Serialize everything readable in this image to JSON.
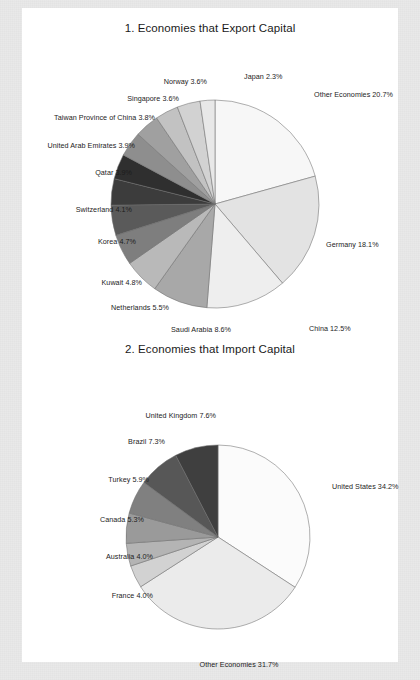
{
  "page": {
    "background_color": "#e9e9e9",
    "sheet_color": "#ffffff"
  },
  "chart_data": [
    {
      "type": "pie",
      "id": "export-capital",
      "title": "1. Economies that Export Capital",
      "xlabel": "",
      "ylabel": "",
      "units": "percent",
      "legend": "none (direct labels with leader placement)",
      "grid": false,
      "start_angle_deg": -90,
      "direction": "clockwise",
      "categories": [
        "Other Economies",
        "Germany",
        "China",
        "Saudi Arabia",
        "Netherlands",
        "Kuwait",
        "Korea",
        "Switzerland",
        "Qatar",
        "United Arab Emirates",
        "Taiwan Province of China",
        "Singapore",
        "Norway",
        "Japan"
      ],
      "values": [
        20.7,
        18.1,
        12.5,
        8.6,
        5.5,
        4.8,
        4.7,
        4.1,
        3.9,
        3.9,
        3.8,
        3.6,
        3.6,
        2.3
      ],
      "slice_colors": [
        "#f7f7f7",
        "#e3e3e3",
        "#eeeeee",
        "#a8a8a8",
        "#b9b9b9",
        "#7e7e7e",
        "#5a5a5a",
        "#3c3c3c",
        "#2f2f2f",
        "#8e8e8e",
        "#a0a0a0",
        "#c2c2c2",
        "#d2d2d2",
        "#e8e8e8"
      ],
      "labels": [
        "Other Economies 20.7%",
        "Germany 18.1%",
        "China 12.5%",
        "Saudi Arabia 8.6%",
        "Netherlands 5.5%",
        "Kuwait 4.8%",
        "Korea 4.7%",
        "Switzerland 4.1%",
        "Qatar 3.9%",
        "United Arab Emirates 3.9%",
        "Taiwan Province of China 3.8%",
        "Singapore 3.6%",
        "Norway 3.6%",
        "Japan 2.3%"
      ]
    },
    {
      "type": "pie",
      "id": "import-capital",
      "title": "2. Economies that Import Capital",
      "xlabel": "",
      "ylabel": "",
      "units": "percent",
      "legend": "none (direct labels with leader placement)",
      "grid": false,
      "start_angle_deg": -90,
      "direction": "clockwise",
      "categories": [
        "United States",
        "Other Economies",
        "France",
        "Australia",
        "Canada",
        "Turkey",
        "Brazil",
        "United Kingdom"
      ],
      "values": [
        34.2,
        31.7,
        4.0,
        4.0,
        5.3,
        5.9,
        7.3,
        7.6
      ],
      "slice_colors": [
        "#fbfbfb",
        "#ebebeb",
        "#d2d2d2",
        "#b4b4b4",
        "#9a9a9a",
        "#808080",
        "#575757",
        "#3f3f3f"
      ],
      "labels": [
        "United States 34.2%",
        "Other Economies 31.7%",
        "France 4.0%",
        "Australia 4.0%",
        "Canada 5.3%",
        "Turkey 5.9%",
        "Brazil 7.3%",
        "United Kingdom 7.6%"
      ]
    }
  ],
  "label_positions": {
    "chart1": [
      {
        "x": 292,
        "y": 83,
        "align": "r"
      },
      {
        "x": 304,
        "y": 233,
        "align": "r"
      },
      {
        "x": 287,
        "y": 317,
        "align": "r"
      },
      {
        "x": 209,
        "y": 318,
        "align": "l"
      },
      {
        "x": 147,
        "y": 296,
        "align": "l"
      },
      {
        "x": 120,
        "y": 271,
        "align": "l"
      },
      {
        "x": 114,
        "y": 230,
        "align": "l"
      },
      {
        "x": 110,
        "y": 198,
        "align": "l"
      },
      {
        "x": 110,
        "y": 161,
        "align": "l"
      },
      {
        "x": 113,
        "y": 134,
        "align": "l"
      },
      {
        "x": 133,
        "y": 106,
        "align": "l"
      },
      {
        "x": 157,
        "y": 87,
        "align": "l"
      },
      {
        "x": 185,
        "y": 70,
        "align": "l"
      },
      {
        "x": 222,
        "y": 65,
        "align": "r"
      }
    ],
    "chart2": [
      {
        "x": 310,
        "y": 475,
        "align": "r"
      },
      {
        "x": 217,
        "y": 653,
        "align": "c"
      },
      {
        "x": 131,
        "y": 584,
        "align": "l"
      },
      {
        "x": 131,
        "y": 545,
        "align": "l"
      },
      {
        "x": 122,
        "y": 508,
        "align": "l"
      },
      {
        "x": 127,
        "y": 468,
        "align": "l"
      },
      {
        "x": 143,
        "y": 430,
        "align": "l"
      },
      {
        "x": 194,
        "y": 404,
        "align": "l"
      }
    ]
  }
}
